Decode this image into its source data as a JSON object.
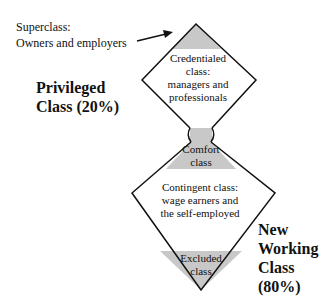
{
  "superclass": {
    "line1": "Superclass:",
    "line2": "Owners and employers"
  },
  "privileged": {
    "line1": "Privileged",
    "line2": "Class (20%)"
  },
  "credentialed": {
    "line1": "Credentialed",
    "line2": "class:",
    "line3": "managers and",
    "line4": "professionals"
  },
  "comfort": {
    "line1": "Comfort",
    "line2": "class"
  },
  "contingent": {
    "line1": "Contingent class:",
    "line2": "wage earners and",
    "line3": "the self-employed"
  },
  "excluded": {
    "line1": "Excluded",
    "line2": "class"
  },
  "new_working": {
    "line1": "New",
    "line2": "Working",
    "line3": "Class",
    "line4": "(80%)"
  },
  "colors": {
    "fill": "#c8c8c8",
    "stroke": "#111111"
  }
}
